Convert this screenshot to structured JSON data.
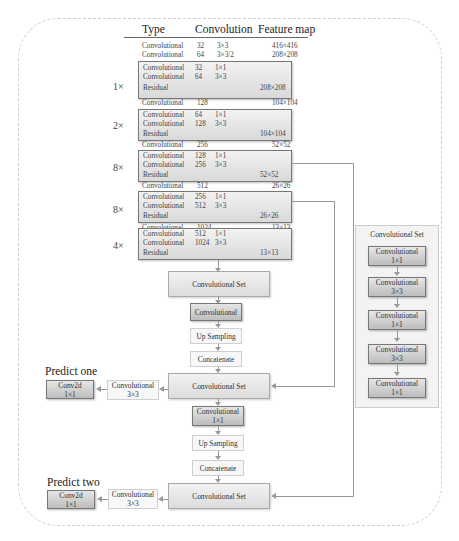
{
  "header": {
    "type": "Type",
    "convolution": "Convolution",
    "feature_map": "Feature map"
  },
  "backbone": {
    "rows": [
      {
        "type": "Convolutional",
        "filters": "32",
        "size": "3×3",
        "out": "416×416"
      },
      {
        "type": "Convolutional",
        "filters": "64",
        "size": "3×3/2",
        "out": "208×208"
      }
    ],
    "stages": [
      {
        "mult": "1×",
        "rows": [
          {
            "type": "Convolutional",
            "filters": "32",
            "size": "1×1"
          },
          {
            "type": "Convolutional",
            "filters": "64",
            "size": "3×3"
          },
          {
            "type": "Residual",
            "out": "208×208"
          }
        ],
        "down": {
          "type": "Convolutional",
          "filters": "128",
          "out": "104×104"
        }
      },
      {
        "mult": "2×",
        "rows": [
          {
            "type": "Convolutional",
            "filters": "64",
            "size": "1×1"
          },
          {
            "type": "Convolutional",
            "filters": "128",
            "size": "3×3"
          },
          {
            "type": "Residual",
            "out": "104×104"
          }
        ],
        "down": {
          "type": "Convolutional",
          "filters": "256",
          "out": "52×52"
        }
      },
      {
        "mult": "8×",
        "rows": [
          {
            "type": "Convolutional",
            "filters": "128",
            "size": "1×1"
          },
          {
            "type": "Convolutional",
            "filters": "256",
            "size": "3×3"
          },
          {
            "type": "Residual",
            "out": "52×52"
          }
        ],
        "down": {
          "type": "Convolutional",
          "filters": "512",
          "out": "26×26"
        }
      },
      {
        "mult": "8×",
        "rows": [
          {
            "type": "Convolutional",
            "filters": "256",
            "size": "1×1"
          },
          {
            "type": "Convolutional",
            "filters": "512",
            "size": "3×3"
          },
          {
            "type": "Residual",
            "out": "26×26"
          }
        ],
        "down": {
          "type": "Convolutional",
          "filters": "1024",
          "out": "13×13"
        }
      },
      {
        "mult": "4×",
        "rows": [
          {
            "type": "Convolutional",
            "filters": "512",
            "size": "1×1"
          },
          {
            "type": "Convolutional",
            "filters": "1024",
            "size": "3×3"
          },
          {
            "type": "Residual",
            "out": "13×13"
          }
        ]
      }
    ]
  },
  "head": {
    "conv_set": "Convolutional Set",
    "conv": "Convolutional",
    "conv_1x1": "1×1",
    "conv_3x3": "3×3",
    "up": "Up Sampling",
    "concat": "Concatenate",
    "conv2d": "Conv2d",
    "predict_one": "Predict one",
    "predict_two": "Predict two"
  },
  "side_panel": {
    "title": "Convolutional Set",
    "items": [
      {
        "label": "Convolutional",
        "size": "1×1"
      },
      {
        "label": "Convolutional",
        "size": "3×3"
      },
      {
        "label": "Convolutional",
        "size": "1×1"
      },
      {
        "label": "Convolutional",
        "size": "3×3"
      },
      {
        "label": "Convolutional",
        "size": "1×1"
      }
    ]
  }
}
